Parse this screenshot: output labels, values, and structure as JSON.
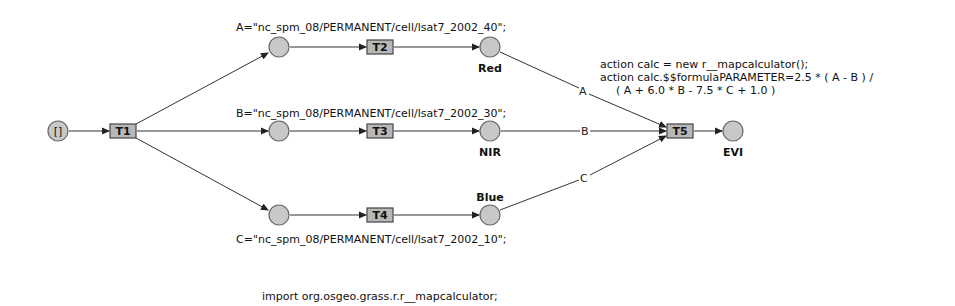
{
  "diagram": {
    "type": "petri-net",
    "places": [
      {
        "id": "start",
        "label": "[]"
      },
      {
        "id": "pA",
        "label": ""
      },
      {
        "id": "pB",
        "label": ""
      },
      {
        "id": "pC",
        "label": ""
      },
      {
        "id": "red",
        "label": "Red"
      },
      {
        "id": "nir",
        "label": "NIR"
      },
      {
        "id": "blue",
        "label": "Blue"
      },
      {
        "id": "evi",
        "label": "EVI"
      }
    ],
    "transitions": [
      {
        "id": "T1",
        "label": "T1"
      },
      {
        "id": "T2",
        "label": "T2"
      },
      {
        "id": "T3",
        "label": "T3"
      },
      {
        "id": "T4",
        "label": "T4"
      },
      {
        "id": "T5",
        "label": "T5"
      }
    ],
    "assignments": {
      "a": "A=\"nc_spm_08/PERMANENT/cell/lsat7_2002_40\";",
      "b": "B=\"nc_spm_08/PERMANENT/cell/lsat7_2002_30\";",
      "c": "C=\"nc_spm_08/PERMANENT/cell/lsat7_2002_10\";"
    },
    "arc_labels": {
      "a": "A",
      "b": "B",
      "c": "C"
    },
    "action_code": [
      "action calc = new r__mapcalculator();",
      "action calc.$$formulaPARAMETER=2.5 * ( A - B ) /",
      "( A + 6.0 * B - 7.5 * C + 1.0 )"
    ],
    "import_line": "import org.osgeo.grass.r.r__mapcalculator;",
    "edges": [
      [
        "start",
        "T1"
      ],
      [
        "T1",
        "pA"
      ],
      [
        "T1",
        "pB"
      ],
      [
        "T1",
        "pC"
      ],
      [
        "pA",
        "T2"
      ],
      [
        "pB",
        "T3"
      ],
      [
        "pC",
        "T4"
      ],
      [
        "T2",
        "red"
      ],
      [
        "T3",
        "nir"
      ],
      [
        "T4",
        "blue"
      ],
      [
        "red",
        "T5"
      ],
      [
        "nir",
        "T5"
      ],
      [
        "blue",
        "T5"
      ],
      [
        "T5",
        "evi"
      ]
    ]
  }
}
